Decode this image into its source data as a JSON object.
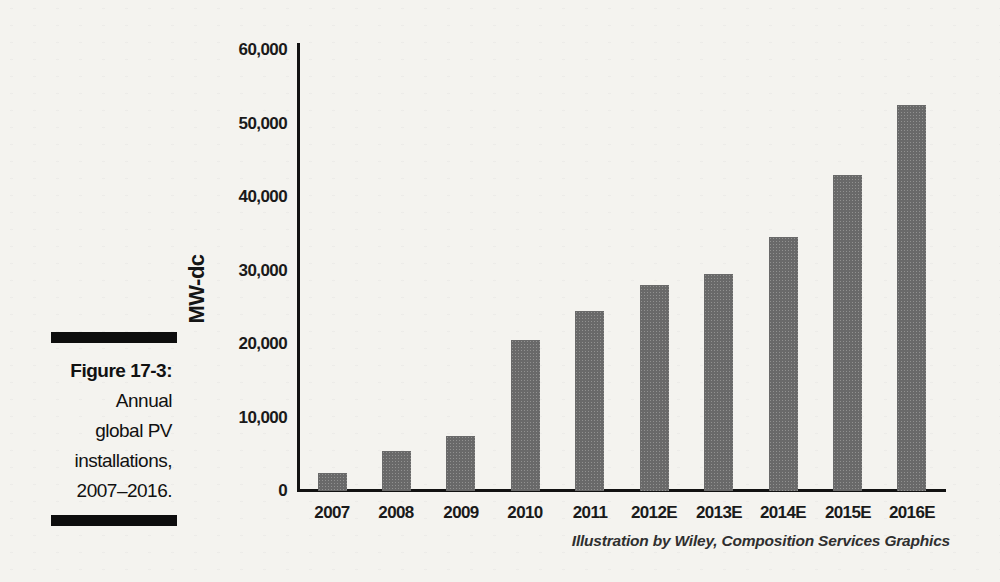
{
  "figure_caption": {
    "label": "Figure 17-3:",
    "lines": [
      "Annual",
      "global PV",
      "installations,",
      "2007–2016."
    ]
  },
  "chart_data": {
    "type": "bar",
    "title": "",
    "xlabel": "",
    "ylabel": "MW-dc",
    "categories": [
      "2007",
      "2008",
      "2009",
      "2010",
      "2011",
      "2012E",
      "2013E",
      "2014E",
      "2015E",
      "2016E"
    ],
    "values": [
      2500,
      5500,
      7500,
      20500,
      24500,
      28000,
      29500,
      34500,
      43000,
      52500
    ],
    "ylim": [
      0,
      60000
    ],
    "ytick_interval": 10000,
    "ytick_labels": [
      "0",
      "10,000",
      "20,000",
      "30,000",
      "40,000",
      "50,000",
      "60,000"
    ],
    "grid": false,
    "legend": "none",
    "bar_color": "#696969"
  },
  "attribution": "Illustration by Wiley, Composition Services Graphics"
}
